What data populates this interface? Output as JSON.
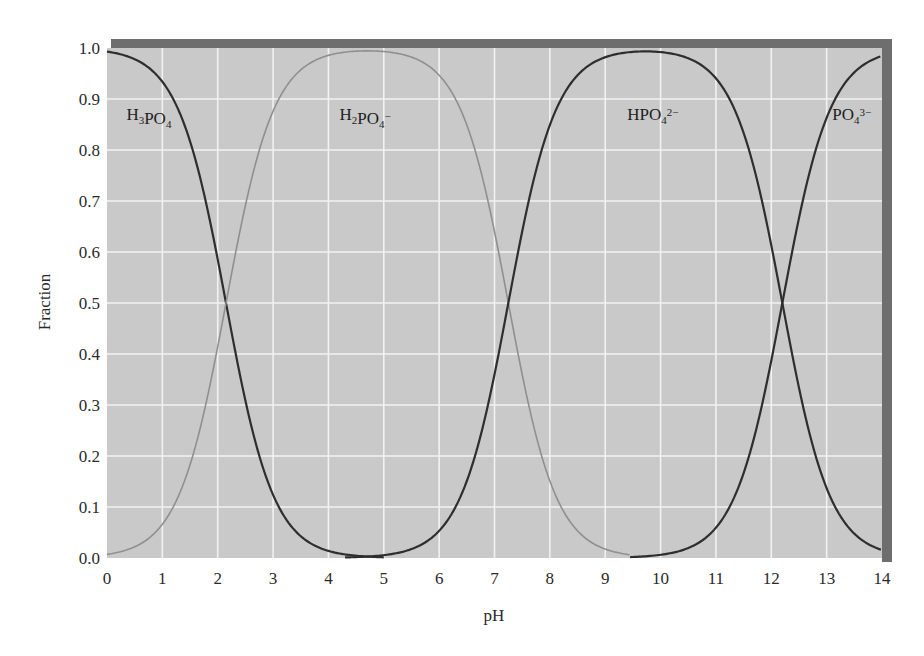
{
  "chart_data": {
    "type": "line",
    "title": "",
    "xlabel": "pH",
    "ylabel": "Fraction",
    "xlim": [
      0,
      14
    ],
    "ylim": [
      0.0,
      1.0
    ],
    "grid": true,
    "x_ticks": [
      "0",
      "1",
      "2",
      "3",
      "4",
      "5",
      "6",
      "7",
      "8",
      "9",
      "10",
      "11",
      "12",
      "13",
      "14"
    ],
    "y_ticks": [
      "0.0",
      "0.1",
      "0.2",
      "0.3",
      "0.4",
      "0.5",
      "0.6",
      "0.7",
      "0.8",
      "0.9",
      "1.0"
    ],
    "pKa": [
      2.15,
      7.25,
      12.2
    ],
    "colors": {
      "plot_bg": "#c9c9c9",
      "grid": "#f2f2f2",
      "shadow": "#6e6e6e",
      "dark_curve": "#2e2e2e",
      "light_curve": "#8f8f8f"
    },
    "series": [
      {
        "name": "H3PO4",
        "label_main": "H",
        "label_parts": [
          [
            "H",
            ""
          ],
          [
            "3",
            "sub"
          ],
          [
            "PO",
            ""
          ],
          [
            "4",
            "sub"
          ]
        ],
        "color": "dark",
        "label_pos": [
          0.35,
          0.87
        ],
        "x": [
          0,
          1,
          2,
          2.15,
          3,
          4,
          5,
          6,
          7,
          8
        ],
        "values": [
          0.99,
          0.93,
          0.59,
          0.5,
          0.12,
          0.01,
          0.0,
          0.0,
          0.0,
          0.0
        ]
      },
      {
        "name": "H2PO4-",
        "label_parts": [
          [
            "H",
            ""
          ],
          [
            "2",
            "sub"
          ],
          [
            "PO",
            ""
          ],
          [
            "4",
            "sub"
          ],
          [
            "−",
            "sup"
          ]
        ],
        "color": "light",
        "label_pos": [
          4.2,
          0.87
        ],
        "x": [
          0,
          1,
          2,
          2.15,
          3,
          4,
          5,
          6,
          7,
          7.25,
          8,
          9,
          10
        ],
        "values": [
          0.01,
          0.07,
          0.41,
          0.5,
          0.88,
          0.99,
          0.99,
          0.95,
          0.64,
          0.5,
          0.15,
          0.02,
          0.0
        ]
      },
      {
        "name": "HPO4 2-",
        "label_parts": [
          [
            "HPO",
            ""
          ],
          [
            "4",
            "sub"
          ],
          [
            "2−",
            "sup"
          ]
        ],
        "color": "dark",
        "label_pos": [
          9.4,
          0.87
        ],
        "x": [
          5,
          6,
          7,
          7.25,
          8,
          9,
          10,
          11,
          12,
          12.2,
          13,
          14
        ],
        "values": [
          0.01,
          0.05,
          0.36,
          0.5,
          0.85,
          0.98,
          0.99,
          0.94,
          0.61,
          0.5,
          0.14,
          0.02
        ]
      },
      {
        "name": "PO4 3-",
        "label_parts": [
          [
            "PO",
            ""
          ],
          [
            "4",
            "sub"
          ],
          [
            "3−",
            "sup"
          ]
        ],
        "color": "dark",
        "label_pos": [
          13.1,
          0.87
        ],
        "x": [
          10,
          11,
          12,
          12.2,
          13,
          14
        ],
        "values": [
          0.01,
          0.06,
          0.39,
          0.5,
          0.86,
          0.98
        ]
      }
    ]
  }
}
